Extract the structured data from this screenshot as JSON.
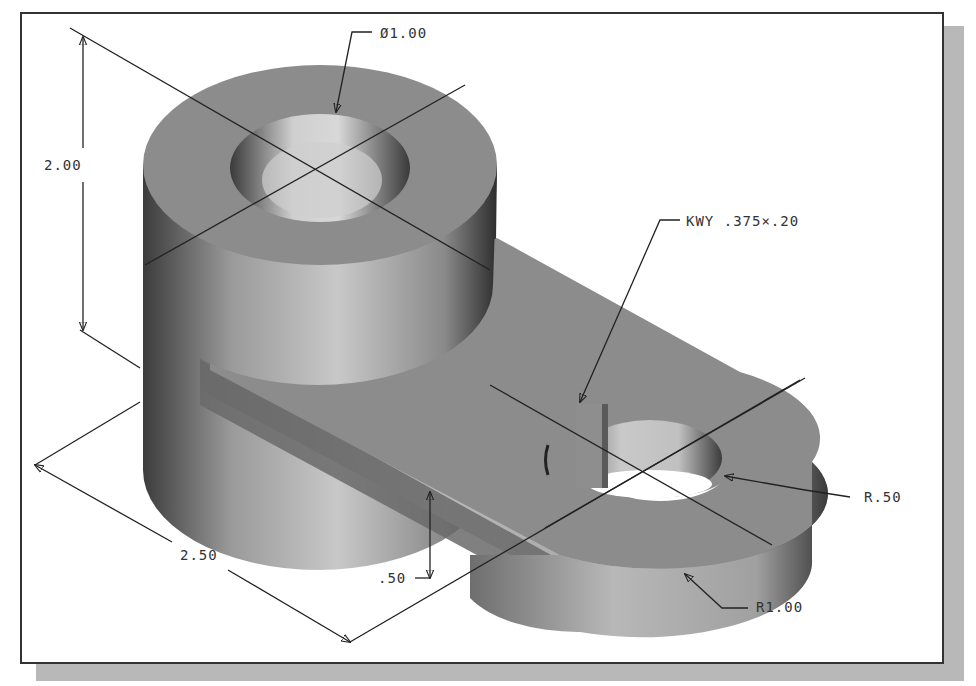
{
  "figure": {
    "type": "isometric CAD part drawing with dimensions",
    "frame_colors": {
      "border": "#333333",
      "shadow": "#b8b8b8",
      "background": "#ffffff"
    },
    "part_colors": {
      "top_face": "#8c8c8c",
      "side_light": "#bdbdbd",
      "side_dark": "#4a4a4a",
      "bore": "#d9d9d9"
    }
  },
  "dimensions": {
    "hole_diameter": {
      "symbol": "Ø",
      "value": "1.00",
      "label": "Ø1.00"
    },
    "height": {
      "value": "2.00",
      "label": "2.00"
    },
    "keyway": {
      "label": "KWY .375×.20"
    },
    "end_radius_small": {
      "label": "R.50"
    },
    "end_radius_large": {
      "label": "R1.00"
    },
    "length": {
      "label": "2.50"
    },
    "arm_thickness": {
      "label": ".50"
    }
  }
}
